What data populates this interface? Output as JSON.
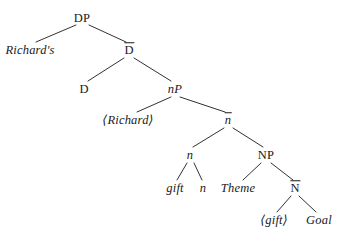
{
  "figure": {
    "kind": "syntax-tree",
    "notation": "X-bar",
    "width": 345,
    "height": 239,
    "background": "#ffffff",
    "ink": "#1a1a1a"
  },
  "nodes": {
    "dp": {
      "label": "DP",
      "x": 82,
      "y": 18,
      "style": "upright",
      "bar": false
    },
    "richards": {
      "label": "Richard's",
      "x": 30,
      "y": 50,
      "style": "italic",
      "bar": false
    },
    "dbar": {
      "label": "D",
      "x": 129,
      "y": 50,
      "style": "upright",
      "bar": true
    },
    "d": {
      "label": "D",
      "x": 84,
      "y": 89,
      "style": "upright",
      "bar": false
    },
    "np_small": {
      "label": "nP",
      "x": 175,
      "y": 89,
      "style": "head-italic",
      "bar": false
    },
    "richard": {
      "label": "⟨Richard⟩",
      "x": 128,
      "y": 120,
      "style": "italic",
      "bar": false
    },
    "nbar": {
      "label": "n",
      "x": 228,
      "y": 120,
      "style": "italic",
      "bar": true
    },
    "n_node": {
      "label": "n",
      "x": 190,
      "y": 155,
      "style": "italic",
      "bar": false
    },
    "np_cap": {
      "label": "NP",
      "x": 266,
      "y": 155,
      "style": "upright",
      "bar": false
    },
    "gift": {
      "label": "gift",
      "x": 175,
      "y": 188,
      "style": "italic",
      "bar": false
    },
    "n_term": {
      "label": "n",
      "x": 203,
      "y": 188,
      "style": "italic",
      "bar": false
    },
    "theme": {
      "label": "Theme",
      "x": 238,
      "y": 188,
      "style": "italic",
      "bar": false
    },
    "nbar_cap": {
      "label": "N",
      "x": 295,
      "y": 188,
      "style": "upright",
      "bar": true
    },
    "gift_copy": {
      "label": "⟨gift⟩",
      "x": 274,
      "y": 220,
      "style": "italic",
      "bar": false
    },
    "goal": {
      "label": "Goal",
      "x": 319,
      "y": 220,
      "style": "italic",
      "bar": false
    }
  },
  "edges": [
    {
      "from": "dp",
      "to": "richards",
      "x1": 76,
      "y1": 25,
      "x2": 36,
      "y2": 42
    },
    {
      "from": "dp",
      "to": "dbar",
      "x1": 89,
      "y1": 25,
      "x2": 126,
      "y2": 42
    },
    {
      "from": "dbar",
      "to": "d",
      "x1": 124,
      "y1": 58,
      "x2": 88,
      "y2": 81
    },
    {
      "from": "dbar",
      "to": "np_small",
      "x1": 134,
      "y1": 58,
      "x2": 171,
      "y2": 81
    },
    {
      "from": "np_small",
      "to": "richard",
      "x1": 171,
      "y1": 97,
      "x2": 137,
      "y2": 112
    },
    {
      "from": "np_small",
      "to": "nbar",
      "x1": 180,
      "y1": 97,
      "x2": 225,
      "y2": 112
    },
    {
      "from": "nbar",
      "to": "n_node",
      "x1": 224,
      "y1": 128,
      "x2": 193,
      "y2": 147
    },
    {
      "from": "nbar",
      "to": "np_cap",
      "x1": 233,
      "y1": 128,
      "x2": 263,
      "y2": 147
    },
    {
      "from": "n_node",
      "to": "gift",
      "x1": 187,
      "y1": 163,
      "x2": 177,
      "y2": 180
    },
    {
      "from": "n_node",
      "to": "n_term",
      "x1": 194,
      "y1": 163,
      "x2": 202,
      "y2": 180
    },
    {
      "from": "np_cap",
      "to": "theme",
      "x1": 261,
      "y1": 163,
      "x2": 243,
      "y2": 180
    },
    {
      "from": "np_cap",
      "to": "nbar_cap",
      "x1": 271,
      "y1": 163,
      "x2": 293,
      "y2": 180
    },
    {
      "from": "nbar_cap",
      "to": "gift_copy",
      "x1": 291,
      "y1": 196,
      "x2": 277,
      "y2": 212
    },
    {
      "from": "nbar_cap",
      "to": "goal",
      "x1": 299,
      "y1": 196,
      "x2": 316,
      "y2": 212
    }
  ]
}
